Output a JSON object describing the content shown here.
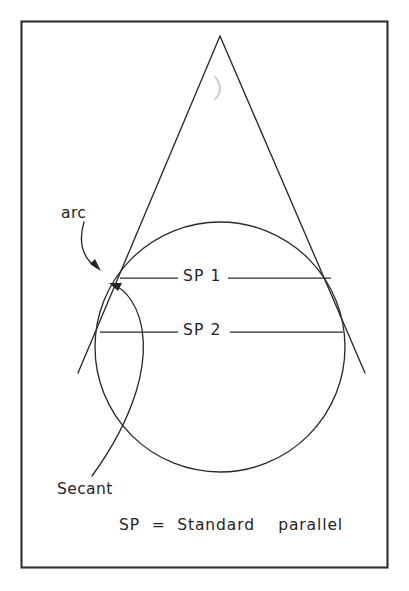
{
  "figure": {
    "kind": "secant-cone-map-projection-diagram",
    "background_color": "#ffffff",
    "ink_color": "#242426",
    "frame": {
      "name": "figure-border",
      "x": 21,
      "y": 21,
      "width": 367,
      "height": 547,
      "stroke_color": "#2e2e30"
    },
    "labels": {
      "arc": "arc",
      "secant": "Secant",
      "standard_parallel_1": "SP 1",
      "standard_parallel_2": "SP 2",
      "legend": "SP  =  Standard    parallel"
    },
    "geometry": {
      "cone": {
        "apex": {
          "x": 220,
          "y": 36
        },
        "left_base": {
          "x": 78,
          "y": 373
        },
        "right_base": {
          "x": 365,
          "y": 373
        }
      },
      "globe_circle": {
        "center_x": 220,
        "center_y": 347,
        "radius": 125
      },
      "standard_parallel_1": {
        "y": 278,
        "x_start": 120,
        "x_end": 331
      },
      "standard_parallel_2": {
        "y": 332,
        "x_start": 100,
        "x_end": 343
      }
    },
    "annotations": [
      {
        "name": "arc-leader",
        "target": "arc of the cone between standard parallels",
        "arrow_tip": {
          "x": 100,
          "y": 272
        }
      },
      {
        "name": "secant-leader",
        "target": "secant line through the globe",
        "arrow_tip": {
          "x": 114,
          "y": 284
        }
      }
    ]
  }
}
